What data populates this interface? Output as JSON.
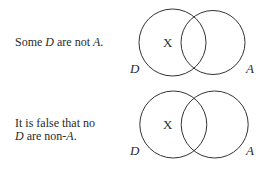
{
  "diagrams": [
    {
      "statement": {
        "pre": "Some ",
        "term1": "D",
        "mid": " are not ",
        "term2": "A",
        "post": "."
      },
      "left_circle_label": "D",
      "right_circle_label": "A",
      "mark": "X",
      "mark_region": "D only"
    },
    {
      "statement": {
        "line1": "It is false that no",
        "term1": "D",
        "mid": " are non-",
        "term2": "A",
        "post": "."
      },
      "left_circle_label": "D",
      "right_circle_label": "A",
      "mark": "X",
      "mark_region": "D only"
    }
  ]
}
